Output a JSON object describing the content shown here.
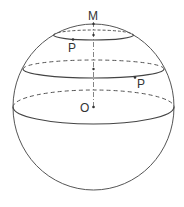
{
  "figure": {
    "type": "sphere-with-latitude-circles",
    "stroke_color": "#555555",
    "background": "#ffffff"
  },
  "labels": {
    "pole": "M",
    "point_upper": "P",
    "point_middle": "P",
    "center": "O"
  },
  "sphere": {
    "cx": 93.5,
    "cy": 107,
    "r": 81
  },
  "circles": [
    {
      "name": "upper-latitude-circle",
      "cy": 35,
      "rx": 40,
      "ry": 5
    },
    {
      "name": "middle-latitude-circle",
      "cy": 69,
      "rx": 70.5,
      "ry": 9
    },
    {
      "name": "equator",
      "cy": 107,
      "rx": 80.5,
      "ry": 17
    }
  ]
}
